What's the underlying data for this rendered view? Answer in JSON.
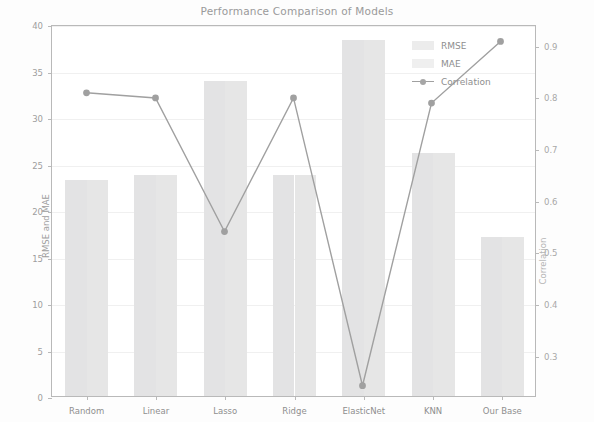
{
  "chart_data": {
    "type": "bar",
    "title": "Performance Comparison of Models",
    "xlabel": "",
    "ylabel": "RMSE and MAE",
    "ylabel_right": "Correlation",
    "categories": [
      "Random",
      "Linear",
      "Lasso",
      "Ridge",
      "ElasticNet",
      "KNN",
      "Our Base"
    ],
    "ylim": [
      0,
      40
    ],
    "yticks": [
      0,
      5,
      10,
      15,
      20,
      25,
      30,
      35,
      40
    ],
    "ylim_right": [
      0.22,
      0.94
    ],
    "yticks_right": [
      0.3,
      0.4,
      0.5,
      0.6,
      0.7,
      0.8,
      0.9
    ],
    "grid": true,
    "legend_position": "upper right",
    "series": [
      {
        "name": "RMSE",
        "kind": "bar",
        "axis": "left",
        "color": "#e3e3e4",
        "values": [
          23.2,
          23.8,
          33.9,
          23.8,
          38.3,
          26.1,
          17.1
        ]
      },
      {
        "name": "MAE",
        "kind": "bar",
        "axis": "left",
        "color": "#e6e6e6",
        "values": [
          23.2,
          23.8,
          33.9,
          23.8,
          38.3,
          26.1,
          17.1
        ]
      },
      {
        "name": "Correlation",
        "kind": "line",
        "axis": "right",
        "color": "#a0a0a0",
        "marker": "o",
        "values": [
          0.81,
          0.8,
          0.54,
          0.8,
          0.24,
          0.79,
          0.91
        ]
      }
    ]
  },
  "legend": {
    "items": [
      {
        "label": "RMSE",
        "icon": "bar-swatch-icon"
      },
      {
        "label": "MAE",
        "icon": "bar-swatch-icon"
      },
      {
        "label": "Correlation",
        "icon": "line-marker-icon"
      }
    ]
  },
  "axes": {
    "left_tick_labels": [
      "0",
      "5",
      "10",
      "15",
      "20",
      "25",
      "30",
      "35",
      "40"
    ],
    "right_tick_labels": [
      "0.3",
      "0.4",
      "0.5",
      "0.6",
      "0.7",
      "0.8",
      "0.9"
    ],
    "left_title": "RMSE and MAE",
    "right_title": "Correlation"
  }
}
